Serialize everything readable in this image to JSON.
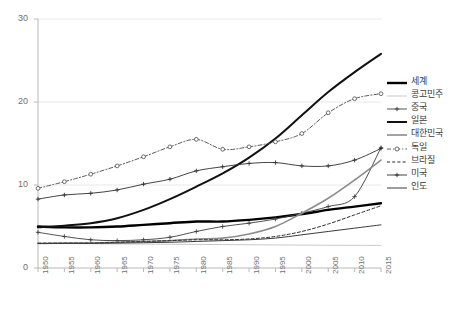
{
  "chart_data": {
    "type": "line",
    "title": "",
    "xlabel": "",
    "ylabel": "",
    "xlim": [
      1950,
      2015
    ],
    "ylim": [
      0,
      30
    ],
    "yticks": [
      0,
      10,
      20,
      30
    ],
    "grid": "horizontal",
    "legend_position": "right",
    "x": [
      1950,
      1955,
      1960,
      1965,
      1970,
      1975,
      1980,
      1985,
      1990,
      1995,
      2000,
      2005,
      2010,
      2015
    ],
    "categories": [
      "1950",
      "1955",
      "1960",
      "1965",
      "1970",
      "1975",
      "1980",
      "1985",
      "1990",
      "1995",
      "2000",
      "2005",
      "2010",
      "2015"
    ],
    "series": [
      {
        "name": "세계",
        "style": "solid-thick",
        "color": "#000000",
        "width": 2.4,
        "marker": "none",
        "values": [
          5.0,
          4.9,
          4.9,
          5.0,
          5.2,
          5.4,
          5.6,
          5.6,
          5.8,
          6.1,
          6.5,
          7.0,
          7.4,
          7.8
        ]
      },
      {
        "name": "콩고민주",
        "style": "solid-thin",
        "color": "#c9c9c9",
        "width": 1.0,
        "marker": "none",
        "values": [
          2.95,
          2.95,
          2.92,
          2.9,
          2.88,
          2.86,
          2.84,
          2.82,
          2.8,
          2.78,
          2.76,
          2.74,
          2.73,
          2.72
        ]
      },
      {
        "name": "중국",
        "style": "solid-marker",
        "color": "#3c3c3c",
        "width": 0.9,
        "marker": "plus",
        "values": [
          4.3,
          3.8,
          3.4,
          3.3,
          3.4,
          3.7,
          4.4,
          5.0,
          5.4,
          5.9,
          6.6,
          7.4,
          8.6,
          14.5
        ]
      },
      {
        "name": "일본",
        "style": "solid-thick",
        "color": "#111111",
        "width": 2.0,
        "marker": "none",
        "values": [
          4.9,
          5.1,
          5.4,
          6.0,
          7.0,
          8.3,
          9.8,
          11.4,
          13.3,
          15.6,
          18.4,
          21.2,
          23.6,
          25.8
        ]
      },
      {
        "name": "대한민국",
        "style": "solid-gray",
        "color": "#8c8c8c",
        "width": 1.6,
        "marker": "none",
        "values": [
          2.95,
          3.0,
          3.0,
          3.1,
          3.2,
          3.3,
          3.5,
          3.6,
          4.1,
          5.0,
          6.6,
          8.4,
          10.6,
          13.0
        ]
      },
      {
        "name": "독일",
        "style": "dashdot-marker",
        "color": "#4a4a4a",
        "width": 0.9,
        "marker": "circle",
        "values": [
          9.6,
          10.4,
          11.3,
          12.3,
          13.4,
          14.6,
          15.5,
          14.3,
          14.6,
          15.2,
          16.2,
          18.7,
          20.4,
          21.0
        ]
      },
      {
        "name": "브라질",
        "style": "dashed",
        "color": "#2a2a2a",
        "width": 1.0,
        "marker": "none",
        "values": [
          3.0,
          3.0,
          3.0,
          3.1,
          3.2,
          3.3,
          3.4,
          3.4,
          3.5,
          3.8,
          4.4,
          5.3,
          6.4,
          7.5
        ]
      },
      {
        "name": "미국",
        "style": "solid-marker",
        "color": "#2e2e2e",
        "width": 0.9,
        "marker": "plus",
        "values": [
          8.3,
          8.8,
          9.0,
          9.4,
          10.1,
          10.7,
          11.7,
          12.2,
          12.6,
          12.7,
          12.3,
          12.3,
          13.0,
          14.4
        ]
      },
      {
        "name": "인도",
        "style": "solid-thin-dark",
        "color": "#3a3a3a",
        "width": 1.0,
        "marker": "none",
        "values": [
          2.95,
          2.95,
          2.98,
          3.0,
          3.05,
          3.1,
          3.2,
          3.3,
          3.4,
          3.6,
          4.0,
          4.4,
          4.8,
          5.2
        ]
      }
    ]
  },
  "axis": {
    "y_labels": [
      "30",
      "20",
      "10",
      "0"
    ],
    "x_labels": [
      "1950",
      "1955",
      "1960",
      "1965",
      "1970",
      "1975",
      "1980",
      "1985",
      "1990",
      "1995",
      "2000",
      "2005",
      "2010",
      "2015"
    ]
  },
  "legend": {
    "items": [
      {
        "label": "세계",
        "key": "line-thick-black"
      },
      {
        "label": "콩고민주",
        "key": "line-thin-lightgray"
      },
      {
        "label": "중국",
        "key": "line-plus-marker"
      },
      {
        "label": "일본",
        "key": "line-thick-black"
      },
      {
        "label": "대한민국",
        "key": "line-gray"
      },
      {
        "label": "독일",
        "key": "line-dashdot-circle"
      },
      {
        "label": "브라질",
        "key": "line-dashed"
      },
      {
        "label": "미국",
        "key": "line-plus-marker"
      },
      {
        "label": "인도",
        "key": "line-thin-dark"
      }
    ]
  },
  "colors": {
    "axis": "#b8b8b8",
    "grid": "#e8e8e8",
    "tick_text": "#6f6f6f",
    "legend_text": "#3a3a3a"
  }
}
